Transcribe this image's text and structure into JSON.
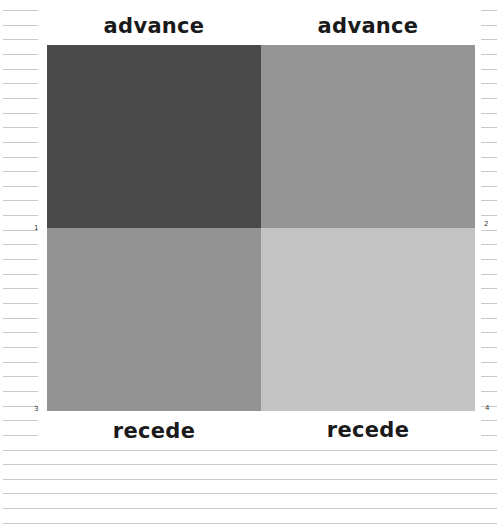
{
  "labels": {
    "top_left": "advance",
    "top_right": "advance",
    "bottom_left": "recede",
    "bottom_right": "recede"
  },
  "quadrants": [
    {
      "position": "top-left",
      "color": "#4a4a4a"
    },
    {
      "position": "top-right",
      "color": "#959595"
    },
    {
      "position": "bottom-left",
      "color": "#939393"
    },
    {
      "position": "bottom-right",
      "color": "#c4c4c4"
    }
  ],
  "margin_numbers": {
    "n1": "1",
    "n2": "2",
    "n3": "3",
    "n4": "4"
  },
  "colors": {
    "rule": "#c8c8c8",
    "text": "#1a1a1a"
  }
}
